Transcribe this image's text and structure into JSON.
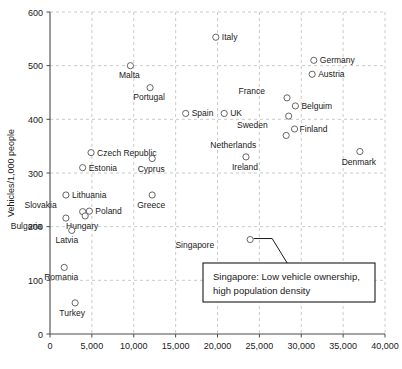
{
  "chart_data": {
    "type": "scatter",
    "title": "",
    "xlabel": "",
    "ylabel": "Vehicles/1,000 people",
    "xlim": [
      0,
      40000
    ],
    "ylim": [
      0,
      600
    ],
    "grid": true,
    "legend": "none",
    "xticks": [
      "0",
      "5,000",
      "10,000",
      "15,000",
      "20,000",
      "25,000",
      "30,000",
      "35,000",
      "40,000"
    ],
    "xtick_values": [
      0,
      5000,
      10000,
      15000,
      20000,
      25000,
      30000,
      35000,
      40000
    ],
    "yticks": [
      "0",
      "100",
      "200",
      "300",
      "400",
      "500",
      "600"
    ],
    "ytick_values": [
      0,
      100,
      200,
      300,
      400,
      500,
      600
    ],
    "points": [
      {
        "label": "Italy",
        "x": 19800,
        "y": 553,
        "lx": 6,
        "ly": 3
      },
      {
        "label": "Germany",
        "x": 31500,
        "y": 510,
        "lx": 6,
        "ly": 3
      },
      {
        "label": "Austria",
        "x": 31300,
        "y": 484,
        "lx": 6,
        "ly": 3
      },
      {
        "label": "Malta",
        "x": 9600,
        "y": 500,
        "lx": -1,
        "ly": 12
      },
      {
        "label": "Portugal",
        "x": 11950,
        "y": 459,
        "lx": -1,
        "ly": 12
      },
      {
        "label": "France",
        "x": 28300,
        "y": 440,
        "lx": -22,
        "ly": -4
      },
      {
        "label": "Belguim",
        "x": 29300,
        "y": 425,
        "lx": 6,
        "ly": 3
      },
      {
        "label": "Sweden",
        "x": 28500,
        "y": 406,
        "lx": -21,
        "ly": 12
      },
      {
        "label": "Spain",
        "x": 16200,
        "y": 411,
        "lx": 6,
        "ly": 3
      },
      {
        "label": "UK",
        "x": 20800,
        "y": 411,
        "lx": 6,
        "ly": 3
      },
      {
        "label": "Finland",
        "x": 29200,
        "y": 382,
        "lx": 5,
        "ly": 3
      },
      {
        "label": "Netherlands",
        "x": 28200,
        "y": 370,
        "lx": -30,
        "ly": 13
      },
      {
        "label": "Czech Republic",
        "x": 4900,
        "y": 338,
        "lx": 6,
        "ly": 3
      },
      {
        "label": "Cyprus",
        "x": 12200,
        "y": 327,
        "lx": -1,
        "ly": 13
      },
      {
        "label": "Ireland",
        "x": 23400,
        "y": 330,
        "lx": -1,
        "ly": 13
      },
      {
        "label": "Estonia",
        "x": 3900,
        "y": 310,
        "lx": 6,
        "ly": 3
      },
      {
        "label": "Denmark",
        "x": 37000,
        "y": 340,
        "lx": -1,
        "ly": 13
      },
      {
        "label": "Lithuania",
        "x": 1900,
        "y": 259,
        "lx": 6,
        "ly": 3
      },
      {
        "label": "Greece",
        "x": 12200,
        "y": 259,
        "lx": -1,
        "ly": 13
      },
      {
        "label": "Slovakia",
        "x": 3900,
        "y": 228,
        "lx": -26,
        "ly": -4
      },
      {
        "label": "Poland",
        "x": 4700,
        "y": 229,
        "lx": 6,
        "ly": 3
      },
      {
        "label": "Hungary",
        "x": 4200,
        "y": 220,
        "lx": -3,
        "ly": 13
      },
      {
        "label": "Bulgaria",
        "x": 1900,
        "y": 216,
        "lx": -24,
        "ly": 11
      },
      {
        "label": "Latvia",
        "x": 2600,
        "y": 193,
        "lx": -5,
        "ly": 13
      },
      {
        "label": "Romania",
        "x": 1700,
        "y": 124,
        "lx": -3,
        "ly": 13
      },
      {
        "label": "Turkey",
        "x": 3000,
        "y": 58,
        "lx": -3,
        "ly": 13
      },
      {
        "label": "Singapore",
        "x": 23900,
        "y": 176,
        "lx": -36,
        "ly": 8
      }
    ],
    "annotation": {
      "target_label": "Singapore",
      "line1": "Singapore: Low vehicle ownership,",
      "line2": "high population density"
    }
  },
  "colors": {
    "background": "#ffffff",
    "grid": "#bdbdbd",
    "axis": "#4a4a4a",
    "marker_stroke": "#555555",
    "text": "#1a1a1a"
  }
}
